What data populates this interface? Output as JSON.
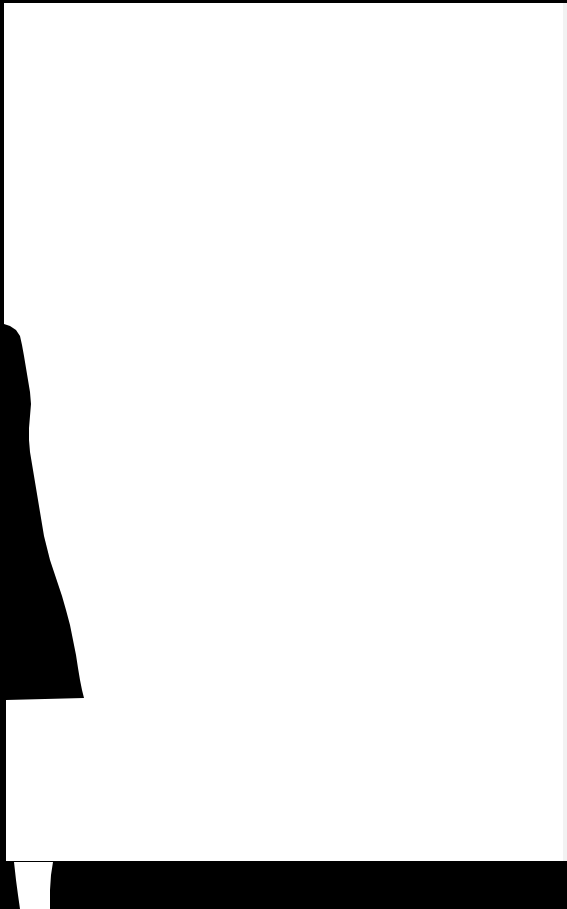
{
  "page": {
    "type": "blank-scanned-page",
    "text_content": "",
    "colors": {
      "paper": "#ffffff",
      "background": "#000000",
      "edge_shadow": "#f4f4f4"
    }
  }
}
